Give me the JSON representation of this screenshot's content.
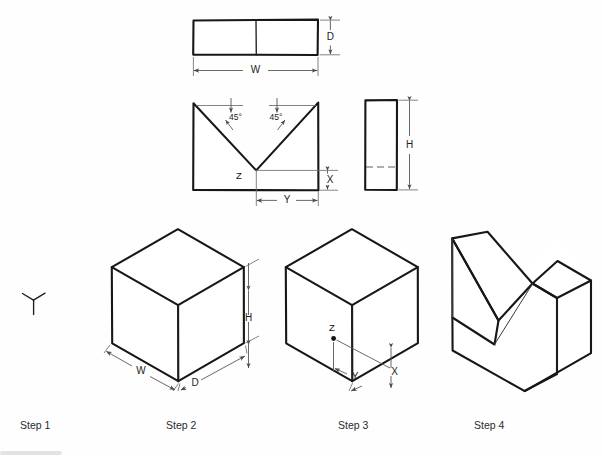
{
  "document": {
    "title": "V-Block Construction Steps",
    "background_color": "#fefefe",
    "line_color": "#171717",
    "dimension_color": "#585858"
  },
  "orthographic_views": {
    "top_view": {
      "name": "Top View",
      "dimensions": [
        {
          "label": "W",
          "orientation": "horizontal",
          "description": "overall width"
        },
        {
          "label": "D",
          "orientation": "vertical",
          "description": "overall depth"
        }
      ]
    },
    "front_view": {
      "name": "Front View",
      "dimensions": [
        {
          "label": "Y",
          "orientation": "horizontal",
          "description": "half notch span"
        },
        {
          "label": "X",
          "orientation": "vertical",
          "description": "height below notch vertex"
        }
      ],
      "angles": [
        {
          "label": "45°",
          "side": "left"
        },
        {
          "label": "45°",
          "side": "right"
        }
      ],
      "points": [
        {
          "label": "Z",
          "description": "V-notch vertex"
        }
      ]
    },
    "side_view": {
      "name": "Side View",
      "dimensions": [
        {
          "label": "H",
          "orientation": "vertical",
          "description": "overall height"
        }
      ],
      "hidden_line": true
    }
  },
  "steps": [
    {
      "id": "step-1",
      "caption": "Step 1",
      "graphic": "axis-tripod-icon",
      "description": "Establish coordinate origin / axes"
    },
    {
      "id": "step-2",
      "caption": "Step 2",
      "graphic": "isometric-block",
      "description": "Draw rectangular block",
      "dimensions": [
        {
          "label": "W"
        },
        {
          "label": "D"
        },
        {
          "label": "H"
        }
      ]
    },
    {
      "id": "step-3",
      "caption": "Step 3",
      "graphic": "isometric-block-located",
      "description": "Locate notch point Z",
      "dimensions": [
        {
          "label": "Y"
        },
        {
          "label": "X"
        }
      ],
      "points": [
        {
          "label": "Z"
        }
      ]
    },
    {
      "id": "step-4",
      "caption": "Step 4",
      "graphic": "isometric-v-block",
      "description": "Cut the 90° V-groove"
    }
  ]
}
